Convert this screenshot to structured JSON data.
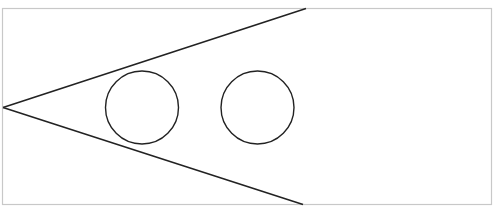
{
  "diagram": {
    "canvas": {
      "width": 494,
      "height": 211,
      "background": "#ffffff"
    },
    "frame": {
      "x": 2.5,
      "y": 8.5,
      "width": 489,
      "height": 196,
      "stroke": "#c8c8c8"
    },
    "wedge": {
      "apex": [
        3,
        107.5
      ],
      "top_end": [
        306,
        8.5
      ],
      "bottom_end": [
        303,
        204.5
      ],
      "stroke": "#222222"
    },
    "circles": [
      {
        "cx": 142,
        "cy": 107.5,
        "r": 36.5,
        "stroke": "#222222"
      },
      {
        "cx": 257.5,
        "cy": 107.5,
        "r": 36.5,
        "stroke": "#222222"
      }
    ]
  }
}
